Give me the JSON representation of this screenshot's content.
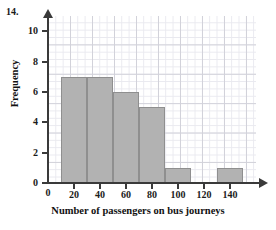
{
  "question_number": "14.",
  "chart_data": {
    "type": "bar",
    "title": "",
    "subtitle": "",
    "xlabel": "Number of passengers on bus journeys",
    "ylabel": "Frequency",
    "xlim": [
      0,
      160
    ],
    "ylim": [
      0,
      11
    ],
    "grid": true,
    "legend": null,
    "x_ticks": [
      "0",
      "20",
      "40",
      "60",
      "80",
      "100",
      "120",
      "140"
    ],
    "x_tick_values": [
      0,
      20,
      40,
      60,
      80,
      100,
      120,
      140
    ],
    "y_ticks": [
      "0",
      "2",
      "4",
      "6",
      "8",
      "10"
    ],
    "y_tick_values": [
      0,
      2,
      4,
      6,
      8,
      10
    ],
    "bin_width": 20,
    "bins": [
      {
        "start": 10,
        "end": 30,
        "frequency": 7
      },
      {
        "start": 30,
        "end": 50,
        "frequency": 7
      },
      {
        "start": 50,
        "end": 70,
        "frequency": 6
      },
      {
        "start": 70,
        "end": 90,
        "frequency": 5
      },
      {
        "start": 90,
        "end": 110,
        "frequency": 1
      },
      {
        "start": 110,
        "end": 130,
        "frequency": 0
      },
      {
        "start": 130,
        "end": 150,
        "frequency": 1
      }
    ],
    "categories": [
      "10-30",
      "30-50",
      "50-70",
      "70-90",
      "90-110",
      "110-130",
      "130-150"
    ],
    "values": [
      7,
      7,
      6,
      5,
      1,
      0,
      1
    ],
    "colors": {
      "bar_fill": "#b2b2b2",
      "bar_stroke": "#8f8f8f",
      "axis": "#3a3a3a",
      "grid_major": "#d2d2da",
      "grid_minor": "#e9e9ef",
      "text": "#111111",
      "background": "#ffffff"
    }
  }
}
